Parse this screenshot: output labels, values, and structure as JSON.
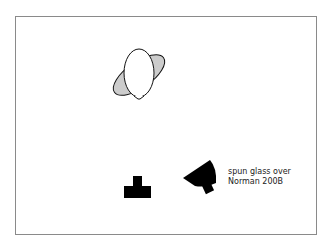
{
  "diagram": {
    "type": "lighting-diagram",
    "elements": [
      {
        "id": "subject",
        "kind": "balloon-with-reflector",
        "fill": "#ffffff",
        "reflector_fill": "#cccccc"
      },
      {
        "id": "camera",
        "kind": "camera-symbol",
        "fill": "#000000"
      },
      {
        "id": "light",
        "kind": "strobe-dish",
        "fill": "#000000"
      }
    ],
    "label": {
      "line1": "spun glass over",
      "line2": "Norman 200B"
    }
  }
}
